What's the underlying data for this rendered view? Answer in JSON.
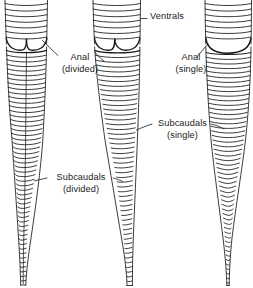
{
  "figure": {
    "background_color": "#ffffff",
    "ink_color": "#1a1a1a",
    "width": 253,
    "height": 288
  },
  "labels": {
    "ventrals": {
      "line1": "Ventrals",
      "line2": "",
      "x": 150,
      "y": 15
    },
    "anal_divided": {
      "line1": "Anal",
      "line2": "(divided)",
      "x": 57,
      "y": 56
    },
    "anal_single": {
      "line1": "Anal",
      "line2": "(single)",
      "x": 170,
      "y": 56
    },
    "subcaudals_single": {
      "line1": "Subcaudals",
      "line2": "(single)",
      "x": 155,
      "y": 118
    },
    "subcaudals_divided": {
      "line1": "Subcaudals",
      "line2": "(divided)",
      "x": 50,
      "y": 172
    }
  },
  "specimens": [
    {
      "name": "left-tail",
      "anal_plate": "divided",
      "subcaudals": "divided",
      "ventral_rows": 8,
      "subcaudal_rows": 46
    },
    {
      "name": "middle-tail",
      "anal_plate": "divided",
      "subcaudals": "single",
      "ventral_rows": 8,
      "subcaudal_rows": 50
    },
    {
      "name": "right-tail",
      "anal_plate": "single",
      "subcaudals": "single",
      "ventral_rows": 8,
      "subcaudal_rows": 48
    }
  ]
}
